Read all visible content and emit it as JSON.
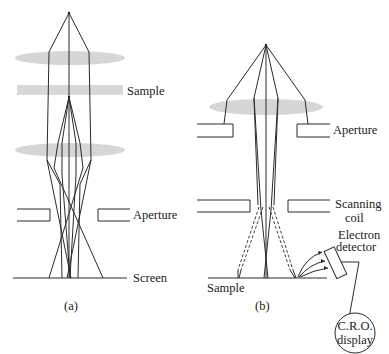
{
  "figure": {
    "panel_a": {
      "caption": "(a)",
      "labels": {
        "sample": "Sample",
        "aperture": "Aperture",
        "screen": "Screen"
      }
    },
    "panel_b": {
      "caption": "(b)",
      "labels": {
        "aperture": "Aperture",
        "scanning_coil_line1": "Scanning",
        "scanning_coil_line2": "coil",
        "electron_detector_line1": "Electron",
        "electron_detector_line2": "detector",
        "sample": "Sample",
        "display_line1": "C.R.O.",
        "display_line2": "display"
      }
    },
    "colors": {
      "lens": "#cfcfcf",
      "line": "#2a2a2a",
      "background": "#ffffff"
    }
  }
}
